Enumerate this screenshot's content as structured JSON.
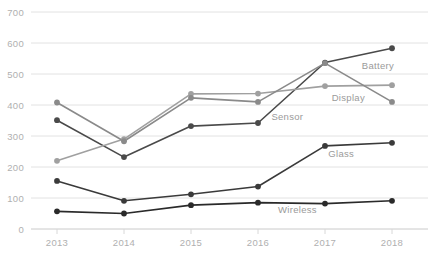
{
  "chart_data": {
    "type": "line",
    "title": "",
    "xlabel": "",
    "ylabel": "",
    "categories": [
      "2013",
      "2014",
      "2015",
      "2016",
      "2017",
      "2018"
    ],
    "x": [
      2013,
      2014,
      2015,
      2016,
      2017,
      2018
    ],
    "ylim": [
      0,
      700
    ],
    "yticks": [
      0,
      100,
      200,
      300,
      400,
      500,
      600,
      700
    ],
    "ytick_labels": [
      "0",
      "100",
      "200",
      "300",
      "400",
      "500",
      "600",
      "700"
    ],
    "grid": "horizontal",
    "legend": "inline-annotations",
    "series": [
      {
        "name": "Battery",
        "color": "#4a4a4a",
        "values": [
          351,
          232,
          332,
          342,
          537,
          583
        ],
        "label_x": 2017.55,
        "label_y": 515
      },
      {
        "name": "Display",
        "color": "#a0a0a0",
        "values": [
          220,
          290,
          436,
          437,
          461,
          464
        ],
        "label_x": 2017.1,
        "label_y": 412
      },
      {
        "name": "Sensor",
        "color": "#8a8a8a",
        "values": [
          408,
          283,
          423,
          410,
          535,
          410
        ],
        "label_x": 2016.2,
        "label_y": 352
      },
      {
        "name": "Glass",
        "color": "#3a3a3a",
        "values": [
          155,
          91,
          112,
          137,
          268,
          278
        ],
        "label_x": 2017.05,
        "label_y": 232
      },
      {
        "name": "Wireless",
        "color": "#2a2a2a",
        "values": [
          57,
          50,
          77,
          85,
          82,
          91
        ],
        "label_x": 2016.3,
        "label_y": 52
      }
    ],
    "colors": {
      "grid": "#e2e2e2",
      "axis": "#d8d8d8",
      "tick_label": "#b0b0b0",
      "background": "#ffffff"
    }
  }
}
